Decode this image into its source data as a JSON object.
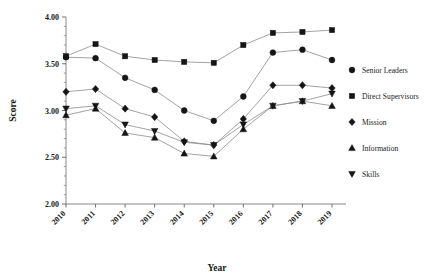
{
  "chart": {
    "type": "line",
    "title": "",
    "xlabel": "Year",
    "ylabel": "Score"
  },
  "axes": {
    "y_ticks": [
      "2.00",
      "2.50",
      "3.00",
      "3.50",
      "4.00"
    ],
    "y_min": 2.0,
    "y_max": 4.0,
    "y_minor_step": 0.1,
    "x_ticks": [
      "2010",
      "2011",
      "2012",
      "2013",
      "2014",
      "2015",
      "2016",
      "2017",
      "2018",
      "2019"
    ],
    "grid": "off",
    "x_label_rotation": -45
  },
  "legend": {
    "position": "right",
    "items": [
      {
        "label": "Senior Leaders",
        "marker": "circle"
      },
      {
        "label": "Direct Supervisors",
        "marker": "square"
      },
      {
        "label": "Mission",
        "marker": "diamond"
      },
      {
        "label": "Information",
        "marker": "triangle-up"
      },
      {
        "label": "Skills",
        "marker": "triangle-down"
      }
    ]
  },
  "chart_data": {
    "type": "line",
    "title": "",
    "xlabel": "Year",
    "ylabel": "Score",
    "ylim": [
      2.0,
      4.0
    ],
    "categories": [
      "2010",
      "2011",
      "2012",
      "2013",
      "2014",
      "2015",
      "2016",
      "2017",
      "2018",
      "2019"
    ],
    "grid": false,
    "legend_position": "right",
    "series": [
      {
        "name": "Senior Leaders",
        "marker": "circle",
        "values": [
          3.57,
          3.56,
          3.35,
          3.22,
          3.0,
          2.89,
          3.15,
          3.62,
          3.65,
          3.54
        ]
      },
      {
        "name": "Direct Supervisors",
        "marker": "square",
        "values": [
          3.58,
          3.71,
          3.58,
          3.54,
          3.52,
          3.51,
          3.7,
          3.83,
          3.84,
          3.86
        ]
      },
      {
        "name": "Mission",
        "marker": "diamond",
        "values": [
          3.2,
          3.23,
          3.02,
          2.93,
          2.67,
          2.63,
          2.91,
          3.27,
          3.27,
          3.24
        ]
      },
      {
        "name": "Information",
        "marker": "triangle-up",
        "values": [
          2.95,
          3.02,
          2.76,
          2.71,
          2.54,
          2.51,
          2.8,
          3.05,
          3.1,
          3.05
        ]
      },
      {
        "name": "Skills",
        "marker": "triangle-down",
        "values": [
          3.02,
          3.05,
          2.85,
          2.78,
          2.66,
          2.63,
          2.85,
          3.05,
          3.1,
          3.18
        ]
      }
    ]
  }
}
